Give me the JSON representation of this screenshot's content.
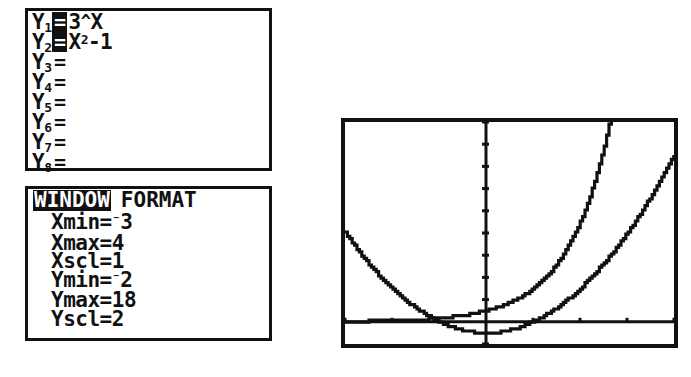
{
  "device": {
    "name": "graphing-calculator",
    "ink_color": "#111111",
    "screen_color": "#ffffff"
  },
  "y_editor": {
    "panel_name": "Y= editor",
    "rows": [
      {
        "label": "Y",
        "index": "1",
        "equals": "=",
        "selected": true,
        "expression": "3^X",
        "expr_base": "3",
        "expr_caret": "^",
        "expr_rest": "X",
        "expr_sup": ""
      },
      {
        "label": "Y",
        "index": "2",
        "equals": "=",
        "selected": true,
        "expression": "X²-1",
        "expr_base": "X",
        "expr_caret": "",
        "expr_rest": "-1",
        "expr_sup": "2"
      },
      {
        "label": "Y",
        "index": "3",
        "equals": "=",
        "selected": false,
        "expression": ""
      },
      {
        "label": "Y",
        "index": "4",
        "equals": "=",
        "selected": false,
        "expression": ""
      },
      {
        "label": "Y",
        "index": "5",
        "equals": "=",
        "selected": false,
        "expression": ""
      },
      {
        "label": "Y",
        "index": "6",
        "equals": "=",
        "selected": false,
        "expression": ""
      },
      {
        "label": "Y",
        "index": "7",
        "equals": "=",
        "selected": false,
        "expression": ""
      },
      {
        "label": "Y",
        "index": "8",
        "equals": "=",
        "selected": false,
        "expression": ""
      }
    ]
  },
  "window_screen": {
    "tabs": [
      {
        "label": "WINDOW",
        "active": true
      },
      {
        "label": "FORMAT",
        "active": false
      }
    ],
    "variables": [
      {
        "name": "Xmin",
        "op": "=",
        "value": "-3",
        "negative": true,
        "value_abs": "3"
      },
      {
        "name": "Xmax",
        "op": "=",
        "value": "4",
        "negative": false,
        "value_abs": "4"
      },
      {
        "name": "Xscl",
        "op": "=",
        "value": "1",
        "negative": false,
        "value_abs": "1"
      },
      {
        "name": "Ymin",
        "op": "=",
        "value": "-2",
        "negative": true,
        "value_abs": "2"
      },
      {
        "name": "Ymax",
        "op": "=",
        "value": "18",
        "negative": false,
        "value_abs": "18"
      },
      {
        "name": "Yscl",
        "op": "=",
        "value": "2",
        "negative": false,
        "value_abs": "2"
      }
    ]
  },
  "chart_data": {
    "type": "line",
    "title": "",
    "xlabel": "",
    "ylabel": "",
    "xlim": [
      -3,
      4
    ],
    "ylim": [
      -2,
      18
    ],
    "xscl": 1,
    "yscl": 2,
    "grid": false,
    "legend": "none",
    "axes_shown": true,
    "x_ticks": [
      -3,
      -2,
      -1,
      0,
      1,
      2,
      3,
      4
    ],
    "y_ticks": [
      -2,
      0,
      2,
      4,
      6,
      8,
      10,
      12,
      14,
      16,
      18
    ],
    "series": [
      {
        "name": "Y1",
        "equation": "3^X",
        "x": [
          -3,
          -2.5,
          -2,
          -1.5,
          -1,
          -0.5,
          0,
          0.5,
          1,
          1.5,
          2,
          2.25,
          2.5,
          2.63
        ],
        "values": [
          0.037,
          0.064,
          0.111,
          0.192,
          0.333,
          0.577,
          1,
          1.732,
          3,
          5.196,
          9,
          11.84,
          15.59,
          17.95
        ]
      },
      {
        "name": "Y2",
        "equation": "X^2-1",
        "x": [
          -3,
          -2.5,
          -2,
          -1.5,
          -1,
          -0.5,
          0,
          0.5,
          1,
          1.5,
          2,
          2.5,
          3,
          3.5,
          4
        ],
        "values": [
          8,
          5.25,
          3,
          1.25,
          0,
          -0.75,
          -1,
          -0.75,
          0,
          1.25,
          3,
          5.25,
          8,
          11.25,
          15
        ]
      }
    ]
  }
}
